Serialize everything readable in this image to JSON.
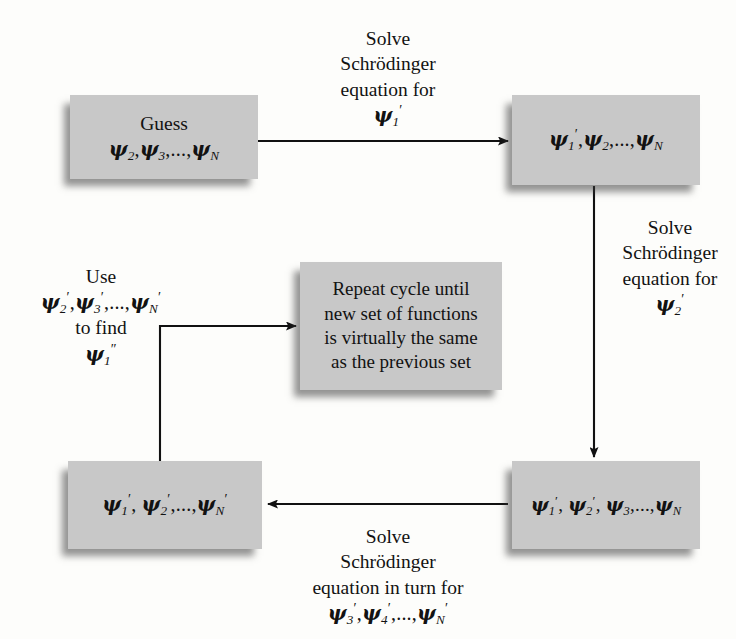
{
  "diagram": {
    "box_fill_color": "#c8c8c8",
    "background_color": "#fdfdfb",
    "text_color": "#121212",
    "boxes": [
      {
        "id": "guess",
        "lines": [
          "Guess",
          "PSI2,PSI3,...,PSIN"
        ],
        "line1": "Guess",
        "line2_html": true
      },
      {
        "id": "first-solution",
        "lines": [
          "PSI1',PSI2,...,PSIN"
        ]
      },
      {
        "id": "repeat-cycle",
        "lines": [
          "Repeat cycle until",
          "new set of functions",
          "is virtually the same",
          "as the previous set"
        ],
        "line1": "Repeat cycle until",
        "line2": "new set of functions",
        "line3": "is virtually the same",
        "line4": "as the previous set"
      },
      {
        "id": "all-primed",
        "lines": [
          "PSI1',PSI2',...,PSIN'"
        ]
      },
      {
        "id": "two-primed",
        "lines": [
          "PSI1',PSI2',PSI3,...,PSIN"
        ]
      }
    ],
    "labels": {
      "top_arrow": {
        "line1": "Solve",
        "line2": "Schrödinger",
        "line3": "equation for",
        "line4_symbol": "psi-1-prime"
      },
      "right_arrow": {
        "line1": "Solve",
        "line2": "Schrödinger",
        "line3": "equation for",
        "line4_symbol": "psi-2-prime"
      },
      "bottom_arrow": {
        "line1": "Solve",
        "line2": "Schrödinger",
        "line3": "equation in turn for",
        "line4_symbol": "psi-3-4-N-primed"
      },
      "left_feedback": {
        "line1": "Use",
        "line2_symbol": "psi-2-3-N-primed",
        "line3": "to find",
        "line4_symbol": "psi-1-double-prime"
      }
    },
    "arrows": [
      {
        "id": "guess-to-first",
        "direction": "right",
        "style": "straight"
      },
      {
        "id": "first-to-two-primed",
        "direction": "down",
        "style": "straight"
      },
      {
        "id": "two-primed-to-all-primed",
        "direction": "left",
        "style": "straight"
      },
      {
        "id": "all-primed-to-repeat",
        "direction": "right",
        "style": "elbow-up-right"
      }
    ]
  }
}
